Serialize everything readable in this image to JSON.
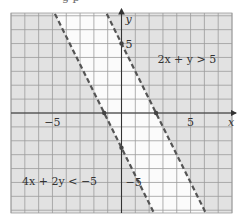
{
  "cropped_header_fragment": "g  p",
  "chart_data": {
    "type": "region-plot",
    "title": "",
    "xlabel": "x",
    "ylabel": "y",
    "xlim": [
      -8,
      8
    ],
    "ylim": [
      -7.2,
      7.2
    ],
    "grid": true,
    "grid_step": 1,
    "x_tick_labels": [
      {
        "value": -5,
        "label": "−5"
      },
      {
        "value": 5,
        "label": "5"
      }
    ],
    "y_tick_labels": [
      {
        "value": 5,
        "label": "5"
      },
      {
        "value": -5,
        "label": "−5"
      }
    ],
    "boundaries": [
      {
        "name": "line-2x-plus-y-eq-5",
        "equation": "2x + y = 5",
        "slope": -2,
        "intercept": 5,
        "style": "dashed",
        "marked_points": [
          [
            0,
            5
          ],
          [
            2.5,
            0
          ]
        ]
      },
      {
        "name": "line-4x-plus-2y-eq-neg5",
        "equation": "4x + 2y = -5",
        "slope": -2,
        "intercept": -2.5,
        "style": "dashed",
        "marked_points": [
          [
            -1.25,
            0
          ],
          [
            0,
            -2.5
          ]
        ]
      }
    ],
    "regions": [
      {
        "label": "2x + y > 5",
        "shaded": true
      },
      {
        "label": "4x + 2y < −5",
        "shaded": true
      },
      {
        "label": "between lines",
        "shaded": false
      }
    ],
    "annotations": [
      {
        "text": "2x + y > 5",
        "x": 2.6,
        "y": 3.6
      },
      {
        "text": "4x + 2y < −5",
        "x": -7.2,
        "y": -5.2
      }
    ],
    "colors": {
      "shade": "#e2e2e2",
      "band": "#fbfbfb",
      "grid": "#9c9c9c",
      "axis": "#333333",
      "line": "#555555"
    }
  }
}
